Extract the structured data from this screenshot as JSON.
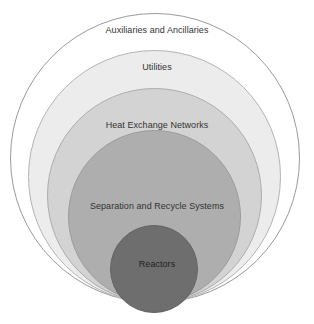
{
  "diagram": {
    "type": "onion-diagram",
    "title": "",
    "background_color": "#ffffff",
    "alignment": "bottom-tangent-concentric",
    "layers": [
      {
        "id": "auxiliaries",
        "label": "Auxiliaries and Ancillaries",
        "level": 1,
        "position": "outermost",
        "fill_color": "#ffffff",
        "stroke_color": "#9a9a9a",
        "diameter_px": 290
      },
      {
        "id": "utilities",
        "label": "Utilities",
        "level": 2,
        "fill_color": "#ececec",
        "stroke_color": "#b4b4b4",
        "diameter_px": 253
      },
      {
        "id": "heat-exchange-networks",
        "label": "Heat Exchange Networks",
        "level": 3,
        "fill_color": "#d3d3d3",
        "stroke_color": "#adadad",
        "diameter_px": 215
      },
      {
        "id": "separation-and-recycle-systems",
        "label": "Separation and Recycle Systems",
        "level": 4,
        "fill_color": "#aeaeae",
        "stroke_color": "#9c9c9c",
        "diameter_px": 173
      },
      {
        "id": "reactors",
        "label": "Reactors",
        "level": 5,
        "position": "innermost",
        "fill_color": "#6e6e6e",
        "stroke_color": "#636363",
        "diameter_px": 88
      }
    ]
  }
}
